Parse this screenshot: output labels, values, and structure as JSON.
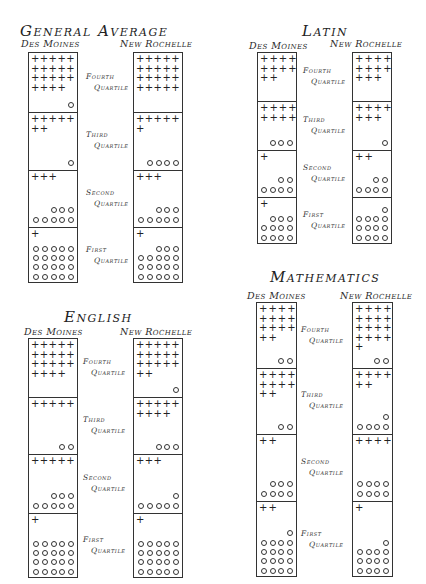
{
  "legend_symbols": {
    "plus": "+",
    "circle": "○"
  },
  "panels": [
    {
      "id": "general-average",
      "title": "General Average",
      "title_pos": [
        20,
        22
      ],
      "heads": {
        "left": "Des Moines",
        "right": "New Rochelle",
        "left_pos": [
          21,
          38
        ],
        "right_pos": [
          120,
          38
        ]
      },
      "box_top": 52,
      "box_height": 231,
      "dividers": [
        59,
        58,
        57,
        57
      ],
      "left_x": 28,
      "right_x": 133,
      "box_width": 50,
      "cols": 5,
      "label_x": 86,
      "quartiles": [
        "Fourth Quartile",
        "Third Quartile",
        "Second Quartile",
        "First Quartile"
      ],
      "des_moines": [
        {
          "plus": 19,
          "circle": 1
        },
        {
          "plus": 7,
          "circle": 1
        },
        {
          "plus": 3,
          "circle": 8
        },
        {
          "plus": 1,
          "circle": 20
        }
      ],
      "new_rochelle": [
        {
          "plus": 20,
          "circle": 0
        },
        {
          "plus": 6,
          "circle": 4
        },
        {
          "plus": 3,
          "circle": 8
        },
        {
          "plus": 1,
          "circle": 18
        }
      ]
    },
    {
      "id": "latin",
      "title": "Latin",
      "title_pos": [
        302,
        22
      ],
      "heads": {
        "left": "Des Moines",
        "right": "New Rochelle",
        "left_pos": [
          249,
          40
        ],
        "right_pos": [
          330,
          38
        ]
      },
      "box_top": 52,
      "box_height": 192,
      "dividers": [
        48,
        49,
        47,
        48
      ],
      "left_x": 257,
      "right_x": 352,
      "box_width": 40,
      "cols": 4,
      "label_x": 303,
      "quartiles": [
        "Fourth Quartile",
        "Third Quartile",
        "Second Quartile",
        "First Quartile"
      ],
      "des_moines": [
        {
          "plus": 10,
          "circle": 0
        },
        {
          "plus": 8,
          "circle": 3
        },
        {
          "plus": 1,
          "circle": 6
        },
        {
          "plus": 1,
          "circle": 11
        }
      ],
      "new_rochelle": [
        {
          "plus": 11,
          "circle": 0
        },
        {
          "plus": 7,
          "circle": 1
        },
        {
          "plus": 2,
          "circle": 6
        },
        {
          "plus": 0,
          "circle": 13
        }
      ]
    },
    {
      "id": "english",
      "title": "English",
      "title_pos": [
        64,
        308
      ],
      "heads": {
        "left": "Des Moines",
        "right": "New Rochelle",
        "left_pos": [
          24,
          326
        ],
        "right_pos": [
          120,
          326
        ]
      },
      "box_top": 338,
      "box_height": 240,
      "dividers": [
        58,
        57,
        59,
        66
      ],
      "left_x": 28,
      "right_x": 133,
      "box_width": 50,
      "cols": 5,
      "label_x": 83,
      "quartiles": [
        "Fourth Quartile",
        "Third Quartile",
        "Second Quartile",
        "First Quartile"
      ],
      "des_moines": [
        {
          "plus": 19,
          "circle": 0
        },
        {
          "plus": 5,
          "circle": 2
        },
        {
          "plus": 5,
          "circle": 8
        },
        {
          "plus": 1,
          "circle": 20
        }
      ],
      "new_rochelle": [
        {
          "plus": 17,
          "circle": 1
        },
        {
          "plus": 9,
          "circle": 3
        },
        {
          "plus": 3,
          "circle": 6
        },
        {
          "plus": 1,
          "circle": 20
        }
      ]
    },
    {
      "id": "mathematics",
      "title": "Mathematics",
      "title_pos": [
        270,
        268
      ],
      "heads": {
        "left": "Des Moines",
        "right": "New Rochelle",
        "left_pos": [
          247,
          290
        ],
        "right_pos": [
          340,
          290
        ]
      },
      "box_top": 302,
      "box_height": 275,
      "dividers": [
        65,
        66,
        67,
        77
      ],
      "left_x": 256,
      "right_x": 352,
      "box_width": 41,
      "cols": 4,
      "label_x": 301,
      "quartiles": [
        "Fourth Quartile",
        "Third Quartile",
        "Second Quartile",
        "First Quartile"
      ],
      "des_moines": [
        {
          "plus": 14,
          "circle": 2
        },
        {
          "plus": 10,
          "circle": 2
        },
        {
          "plus": 2,
          "circle": 7
        },
        {
          "plus": 2,
          "circle": 17
        }
      ],
      "new_rochelle": [
        {
          "plus": 17,
          "circle": 2
        },
        {
          "plus": 6,
          "circle": 5
        },
        {
          "plus": 4,
          "circle": 8
        },
        {
          "plus": 1,
          "circle": 13
        }
      ]
    }
  ]
}
